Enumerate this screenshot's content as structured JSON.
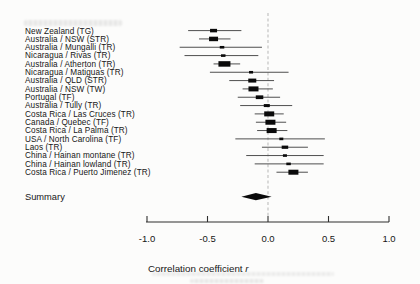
{
  "figure": {
    "background": "#fcfcfb",
    "ink_color": "#161616",
    "ci_line_color": "#4f4f4f",
    "marker_color": "#0a0a0a",
    "zero_line_color": "#bdbdbd"
  },
  "chart_data": {
    "type": "forest",
    "title": "",
    "xlabel_main": "Correlation coefficient",
    "xlabel_var": "r",
    "xlim": [
      -1.0,
      1.0
    ],
    "x_ticks": [
      -1.0,
      -0.5,
      0.0,
      0.5,
      1.0
    ],
    "x_tick_labels": [
      "-1.0",
      "-0.5",
      "0.0",
      "0.5",
      "1.0"
    ],
    "zero_reference": 0.0,
    "studies": [
      {
        "label": "New Zealand (TG)",
        "r": -0.45,
        "ci_low": -0.66,
        "ci_high": -0.22,
        "weight_px": 7
      },
      {
        "label": "Australia / NSW (STR)",
        "r": -0.45,
        "ci_low": -0.57,
        "ci_high": -0.31,
        "weight_px": 9
      },
      {
        "label": "Australia / Mungalli (TR)",
        "r": -0.38,
        "ci_low": -0.73,
        "ci_high": -0.05,
        "weight_px": 4.5
      },
      {
        "label": "Nicaragua / Rivas (TR)",
        "r": -0.37,
        "ci_low": -0.69,
        "ci_high": -0.08,
        "weight_px": 4.5
      },
      {
        "label": "Australia / Atherton (TR)",
        "r": -0.36,
        "ci_low": -0.45,
        "ci_high": -0.23,
        "weight_px": 12
      },
      {
        "label": "Nicaragua / Matiguas (TR)",
        "r": -0.14,
        "ci_low": -0.48,
        "ci_high": 0.17,
        "weight_px": 4
      },
      {
        "label": "Australia / QLD (STR)",
        "r": -0.13,
        "ci_low": -0.32,
        "ci_high": 0.05,
        "weight_px": 8
      },
      {
        "label": "Australia / NSW (TW)",
        "r": -0.12,
        "ci_low": -0.21,
        "ci_high": 0.04,
        "weight_px": 10
      },
      {
        "label": "Portugal (TF)",
        "r": -0.07,
        "ci_low": -0.25,
        "ci_high": 0.1,
        "weight_px": 7.5
      },
      {
        "label": "Australia / Tully (TR)",
        "r": -0.01,
        "ci_low": -0.23,
        "ci_high": 0.2,
        "weight_px": 6
      },
      {
        "label": "Costa Rica / Las Cruces (TR)",
        "r": 0.01,
        "ci_low": -0.11,
        "ci_high": 0.13,
        "weight_px": 10
      },
      {
        "label": "Canada / Quebec (TF)",
        "r": 0.02,
        "ci_low": -0.1,
        "ci_high": 0.15,
        "weight_px": 10
      },
      {
        "label": "Costa Rica / La Palma (TR)",
        "r": 0.03,
        "ci_low": -0.09,
        "ci_high": 0.16,
        "weight_px": 10
      },
      {
        "label": "USA / North Carolina (TF)",
        "r": 0.11,
        "ci_low": -0.27,
        "ci_high": 0.47,
        "weight_px": 4
      },
      {
        "label": "Laos (TR)",
        "r": 0.14,
        "ci_low": -0.05,
        "ci_high": 0.33,
        "weight_px": 6.5
      },
      {
        "label": "China / Hainan montane (TR)",
        "r": 0.14,
        "ci_low": -0.18,
        "ci_high": 0.46,
        "weight_px": 4
      },
      {
        "label": "China / Hainan lowland (TR)",
        "r": 0.17,
        "ci_low": -0.11,
        "ci_high": 0.46,
        "weight_px": 4.5
      },
      {
        "label": "Costa Rica / Puerto Jimenez (TR)",
        "r": 0.21,
        "ci_low": 0.07,
        "ci_high": 0.33,
        "weight_px": 10
      }
    ],
    "summary": {
      "label": "Summary",
      "r": -0.1,
      "ci_low": -0.22,
      "ci_high": 0.03
    }
  }
}
